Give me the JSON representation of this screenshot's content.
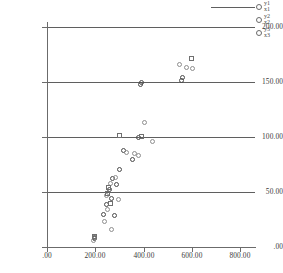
{
  "chart_data": {
    "type": "scatter",
    "title": "",
    "xlabel": "",
    "ylabel": "",
    "xlim": [
      0,
      860
    ],
    "ylim": [
      0,
      205
    ],
    "grid": true,
    "gridlines_y": [
      0,
      50,
      100,
      150,
      200
    ],
    "legend_position": "top-right",
    "y_ticks": [
      ".00",
      "50.00",
      "100.00",
      "150.00",
      "200.00"
    ],
    "y_tick_values": [
      0,
      50,
      100,
      150,
      200
    ],
    "x_ticks": [
      ".00",
      "200.00",
      "400.00",
      "600.00",
      "800.00"
    ],
    "x_tick_values": [
      0,
      200,
      400,
      600,
      800
    ],
    "series": [
      {
        "name": "y1",
        "xname": "x1",
        "color": "#4a4a4a",
        "marker": "open-circle",
        "points": [
          [
            196,
            8
          ],
          [
            198,
            9
          ],
          [
            232,
            30
          ],
          [
            248,
            39
          ],
          [
            258,
            52
          ],
          [
            268,
            44
          ],
          [
            272,
            62
          ],
          [
            278,
            29
          ],
          [
            286,
            57
          ],
          [
            300,
            71
          ],
          [
            318,
            88
          ],
          [
            352,
            80
          ],
          [
            380,
            100
          ],
          [
            386,
            148
          ],
          [
            392,
            150
          ],
          [
            556,
            152
          ],
          [
            560,
            154
          ]
        ]
      },
      {
        "name": "y2",
        "xname": "x2",
        "color": "#8e8e8e",
        "marker": "open-circle",
        "points": [
          [
            192,
            6
          ],
          [
            238,
            23
          ],
          [
            244,
            47
          ],
          [
            252,
            34
          ],
          [
            262,
            58
          ],
          [
            266,
            16
          ],
          [
            284,
            63
          ],
          [
            296,
            43
          ],
          [
            330,
            86
          ],
          [
            362,
            85
          ],
          [
            380,
            83
          ],
          [
            404,
            113
          ],
          [
            436,
            96
          ],
          [
            548,
            166
          ],
          [
            578,
            164
          ],
          [
            600,
            163
          ]
        ]
      },
      {
        "name": "y3",
        "xname": "x3",
        "color": "#6f6f6f",
        "marker": "open-square",
        "points": [
          [
            196,
            10
          ],
          [
            250,
            49
          ],
          [
            256,
            54
          ],
          [
            262,
            40
          ],
          [
            300,
            102
          ],
          [
            392,
            101
          ],
          [
            598,
            172
          ]
        ]
      }
    ]
  },
  "legend": {
    "entries": [
      {
        "y": "y1",
        "x": "x1"
      },
      {
        "y": "y2",
        "x": "x2"
      },
      {
        "y": "y3",
        "x": "x3"
      }
    ]
  }
}
